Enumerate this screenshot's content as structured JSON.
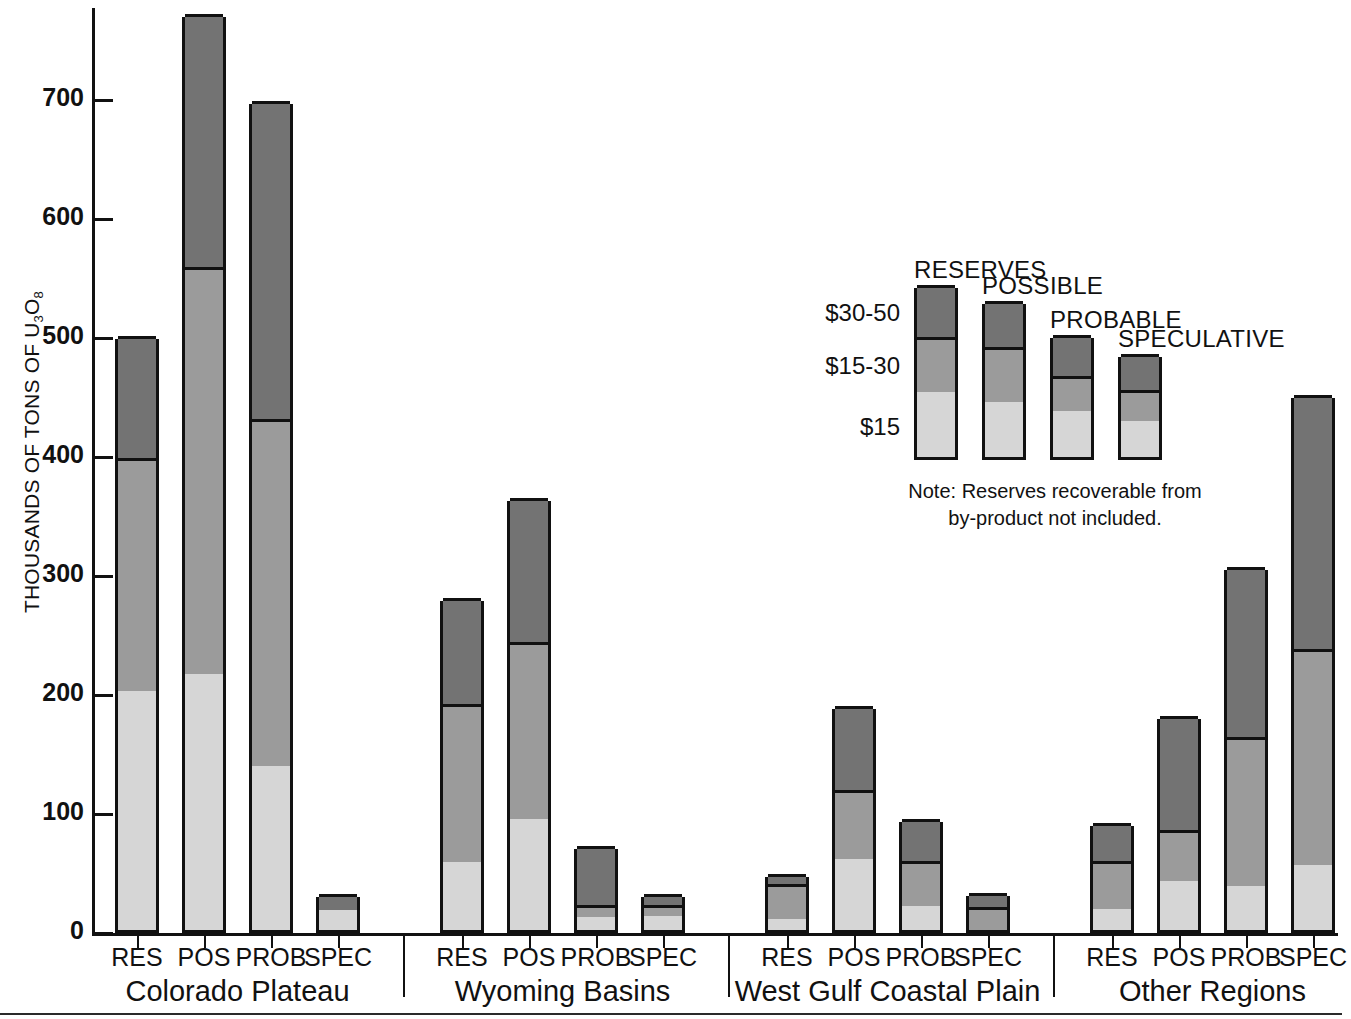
{
  "chart_data": {
    "type": "bar",
    "subtype": "stacked-grouped",
    "title": "",
    "xlabel": "",
    "ylabel": "THOUSANDS OF TONS OF U3O8",
    "ylim": [
      0,
      780
    ],
    "yticks": [
      0,
      100,
      200,
      300,
      400,
      500,
      600,
      700
    ],
    "ytick_labels": [
      "0",
      "100",
      "200",
      "300",
      "400",
      "500",
      "600",
      "700"
    ],
    "grid": false,
    "legend_position": "inside-upper-right",
    "stack_order_bottom_to_top": [
      "$15",
      "$15-30",
      "$30-50"
    ],
    "series": [
      {
        "name": "$15",
        "cost_label": "$15",
        "color": "#d6d6d6"
      },
      {
        "name": "$15-30",
        "cost_label": "$15-30",
        "color": "#9b9b9b"
      },
      {
        "name": "$30-50",
        "cost_label": "$30-50",
        "color": "#737373"
      }
    ],
    "groups": [
      {
        "label": "Colorado Plateau",
        "categories": [
          "RES",
          "POS",
          "PROB",
          "SPEC"
        ],
        "bars": [
          {
            "category": "RES",
            "segments": {
              "$15": 201,
              "$15-30": 196,
              "$30-50": 102
            },
            "total": 499
          },
          {
            "category": "POS",
            "segments": {
              "$15": 215,
              "$15-30": 342,
              "$30-50": 213
            },
            "total": 770
          },
          {
            "category": "PROB",
            "segments": {
              "$15": 138,
              "$15-30": 291,
              "$30-50": 268
            },
            "total": 697
          },
          {
            "category": "SPEC",
            "segments": {
              "$15": 17,
              "$15-30": 0,
              "$30-50": 13
            },
            "total": 30
          }
        ]
      },
      {
        "label": "Wyoming Basins",
        "categories": [
          "RES",
          "POS",
          "PROB",
          "SPEC"
        ],
        "bars": [
          {
            "category": "RES",
            "segments": {
              "$15": 57,
              "$15-30": 133,
              "$30-50": 89
            },
            "total": 279
          },
          {
            "category": "POS",
            "segments": {
              "$15": 93,
              "$15-30": 149,
              "$30-50": 121
            },
            "total": 363
          },
          {
            "category": "PROB",
            "segments": {
              "$15": 11,
              "$15-30": 10,
              "$30-50": 50
            },
            "total": 71
          },
          {
            "category": "SPEC",
            "segments": {
              "$15": 12,
              "$15-30": 9,
              "$30-50": 9
            },
            "total": 30
          }
        ]
      },
      {
        "label": "West Gulf Coastal Plain",
        "categories": [
          "RES",
          "POS",
          "PROB",
          "SPEC"
        ],
        "bars": [
          {
            "category": "RES",
            "segments": {
              "$15": 9,
              "$15-30": 30,
              "$30-50": 8
            },
            "total": 47
          },
          {
            "category": "POS",
            "segments": {
              "$15": 60,
              "$15-30": 58,
              "$30-50": 70
            },
            "total": 188
          },
          {
            "category": "PROB",
            "segments": {
              "$15": 20,
              "$15-30": 38,
              "$30-50": 35
            },
            "total": 93
          },
          {
            "category": "SPEC",
            "segments": {
              "$15": 0,
              "$15-30": 19,
              "$30-50": 12
            },
            "total": 31
          }
        ]
      },
      {
        "label": "Other Regions",
        "categories": [
          "RES",
          "POS",
          "PROB",
          "SPEC"
        ],
        "bars": [
          {
            "category": "RES",
            "segments": {
              "$15": 18,
              "$15-30": 40,
              "$30-50": 32
            },
            "total": 90
          },
          {
            "category": "POS",
            "segments": {
              "$15": 41,
              "$15-30": 43,
              "$30-50": 96
            },
            "total": 180
          },
          {
            "category": "PROB",
            "segments": {
              "$15": 37,
              "$15-30": 125,
              "$30-50": 143
            },
            "total": 305
          },
          {
            "category": "SPEC",
            "segments": {
              "$15": 55,
              "$15-30": 181,
              "$30-50": 214
            },
            "total": 450
          }
        ]
      }
    ]
  },
  "axis": {
    "y_title_prefix": "THOUSANDS OF TONS OF U",
    "y_title_sub1": "3",
    "y_title_mid": "O",
    "y_title_sub2": "8"
  },
  "legend": {
    "entries": [
      {
        "title": "RESERVES",
        "segments": {
          "$15": 1.0,
          "$15-30": 0.85,
          "$30-50": 0.8
        }
      },
      {
        "title": "POSSIBLE",
        "segments": {
          "$15": 0.85,
          "$15-30": 0.85,
          "$30-50": 0.7
        }
      },
      {
        "title": "PROBABLE",
        "segments": {
          "$15": 0.7,
          "$15-30": 0.55,
          "$30-50": 0.62
        }
      },
      {
        "title": "SPECULATIVE",
        "segments": {
          "$15": 0.55,
          "$15-30": 0.48,
          "$30-50": 0.55
        }
      }
    ],
    "price_labels": [
      "$30-50",
      "$15-30",
      "$15"
    ],
    "note_line1": "Note: Reserves recoverable from",
    "note_line2": "by-product not included."
  },
  "colors": {
    "low": "#d6d6d6",
    "mid": "#9b9b9b",
    "high": "#737373",
    "outline": "#111111",
    "background": "#ffffff"
  }
}
